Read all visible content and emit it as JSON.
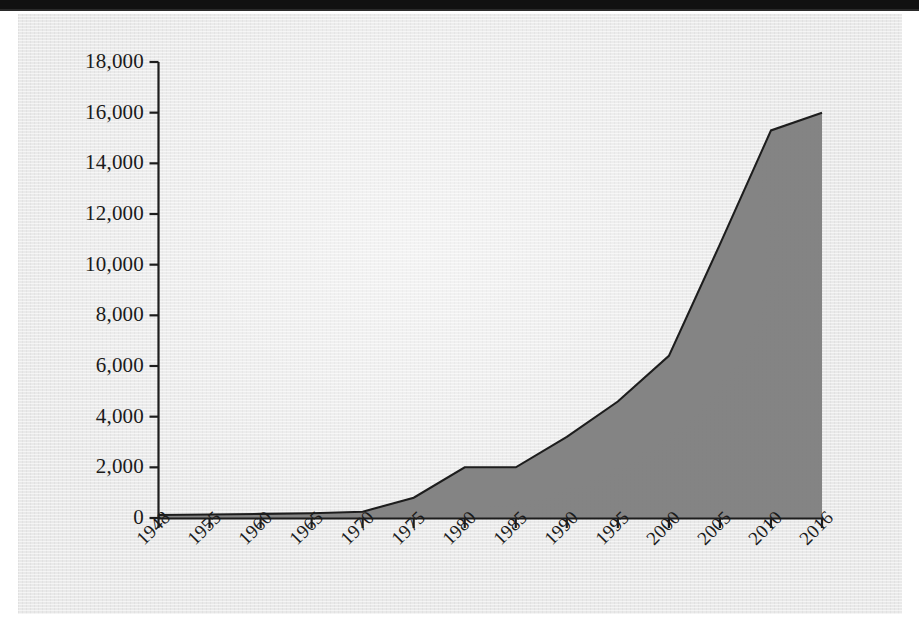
{
  "page": {
    "kind": "scanned-book-page-figure",
    "background_color": "#e9e9e9",
    "scan_edge_color": "#111111"
  },
  "chart_data": {
    "type": "area",
    "title": "",
    "subtitle": "",
    "xlabel": "",
    "ylabel": "",
    "categories": [
      "1948",
      "1955",
      "1960",
      "1965",
      "1970",
      "1975",
      "1980",
      "1985",
      "1990",
      "1995",
      "2000",
      "2005",
      "2010",
      "2016"
    ],
    "values": [
      120,
      140,
      160,
      190,
      250,
      800,
      2000,
      2000,
      3200,
      4600,
      6400,
      10800,
      15300,
      16000
    ],
    "series": [
      {
        "name": "",
        "values": [
          120,
          140,
          160,
          190,
          250,
          800,
          2000,
          2000,
          3200,
          4600,
          6400,
          10800,
          15300,
          16000
        ]
      }
    ],
    "ylim": [
      0,
      18000
    ],
    "ytick_values": [
      0,
      2000,
      4000,
      6000,
      8000,
      10000,
      12000,
      14000,
      16000,
      18000
    ],
    "ytick_labels": [
      "0",
      "2,000",
      "4,000",
      "6,000",
      "8,000",
      "10,000",
      "12,000",
      "14,000",
      "16,000",
      "18,000"
    ],
    "xtick_labels": [
      "1948",
      "1955",
      "1960",
      "1965",
      "1970",
      "1975",
      "1980",
      "1985",
      "1990",
      "1995",
      "2000",
      "2005",
      "2010",
      "2016"
    ],
    "xtick_label_rotation": -45,
    "grid": false,
    "legend": null,
    "legend_position": "none",
    "area_fill_color": "#808080",
    "line_color": "#1d1d1d",
    "axis_color": "#1d1d1d",
    "annotations": []
  }
}
